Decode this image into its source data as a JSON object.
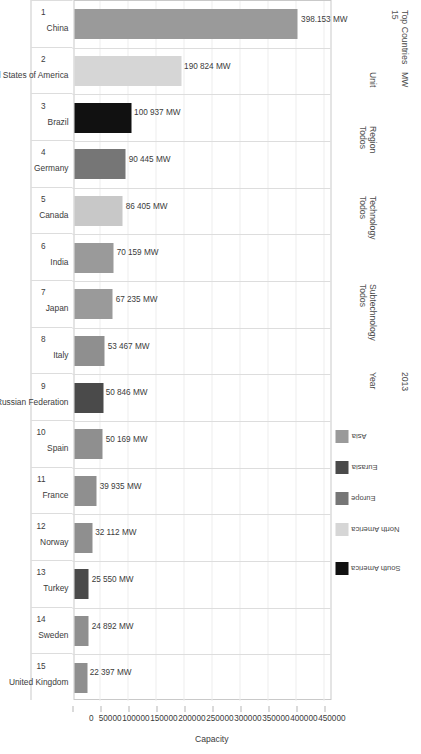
{
  "header": {
    "top_countries_label": "Top Countries",
    "top_countries_value": "15",
    "unit_label": "Unit",
    "unit_value": "MW",
    "region_label": "Region",
    "region_value": "Todos",
    "technology_label": "Technology",
    "technology_value": "Todos",
    "subtechnology_label": "Subtechnology",
    "subtechnology_value": "Todos",
    "year_label": "Year",
    "year_value": "2013"
  },
  "legend": {
    "items": [
      {
        "label": "Asia",
        "color": "#9a9a9a"
      },
      {
        "label": "Eurasia",
        "color": "#4a4a4a"
      },
      {
        "label": "Europe",
        "color": "#767676"
      },
      {
        "label": "North America",
        "color": "#d6d6d6"
      },
      {
        "label": "South America",
        "color": "#111111"
      }
    ]
  },
  "chart_data": {
    "type": "bar",
    "title": "Top Countries",
    "xlabel": "Capacity",
    "ylabel": "",
    "unit": "MW",
    "xlim": [
      0,
      460000
    ],
    "ticks": [
      "0",
      "50000",
      "100000",
      "150000",
      "200000",
      "250000",
      "300000",
      "350000",
      "400000",
      "450000"
    ],
    "tick_values": [
      0,
      50000,
      100000,
      150000,
      200000,
      250000,
      300000,
      350000,
      400000,
      450000
    ],
    "grid": true,
    "legend_position": "top-right",
    "categories": [
      "China",
      "United States of America",
      "Brazil",
      "Germany",
      "Canada",
      "India",
      "Japan",
      "Italy",
      "Russian Federation",
      "Spain",
      "France",
      "Norway",
      "Turkey",
      "Sweden",
      "United Kingdom"
    ],
    "ranks": [
      "1",
      "2",
      "3",
      "4",
      "5",
      "6",
      "7",
      "8",
      "9",
      "10",
      "11",
      "12",
      "13",
      "14",
      "15"
    ],
    "values": [
      398153,
      190824,
      100937,
      90445,
      86405,
      70159,
      67235,
      53467,
      50846,
      50169,
      39935,
      32112,
      25550,
      24892,
      22397
    ],
    "value_labels": [
      "398.153 MW",
      "190 824 MW",
      "100 937 MW",
      "90 445 MW",
      "86 405 MW",
      "70 159 MW",
      "67 235 MW",
      "53 467 MW",
      "50 846 MW",
      "50 169 MW",
      "39 935 MW",
      "32 112 MW",
      "25 550 MW",
      "24 892 MW",
      "22 397 MW"
    ],
    "regions": [
      "Asia",
      "North America",
      "South America",
      "Europe",
      "North America",
      "Asia",
      "Asia",
      "Europe",
      "Eurasia",
      "Europe",
      "Europe",
      "Europe",
      "Eurasia",
      "Europe",
      "Europe"
    ],
    "colors": [
      "#9a9a9a",
      "#d6d6d6",
      "#111111",
      "#767676",
      "#c8c8c8",
      "#9a9a9a",
      "#9a9a9a",
      "#8f8f8f",
      "#4a4a4a",
      "#8f8f8f",
      "#8f8f8f",
      "#8f8f8f",
      "#4a4a4a",
      "#8f8f8f",
      "#8f8f8f"
    ]
  }
}
